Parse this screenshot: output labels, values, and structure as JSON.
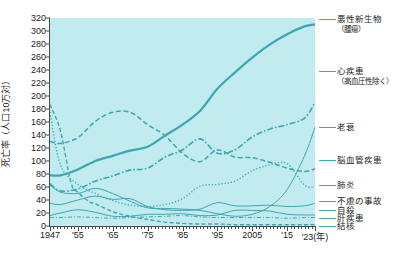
{
  "chart_data": {
    "type": "line",
    "title": "",
    "xlabel": "年",
    "ylabel": "死亡率（人口10万対）",
    "ylim": [
      0,
      320
    ],
    "ytick_step": 20,
    "xlim": [
      1947,
      2023
    ],
    "grid": false,
    "legend_position": "right",
    "background_color": "#c2ebf0",
    "line_color": "#3aa8b0",
    "y_ticks": [
      "0",
      "20",
      "40",
      "60",
      "80",
      "100",
      "120",
      "140",
      "160",
      "180",
      "200",
      "220",
      "240",
      "260",
      "280",
      "300",
      "320"
    ],
    "x_ticks": [
      {
        "label": "1947",
        "year": 1947
      },
      {
        "label": "'55",
        "year": 1955
      },
      {
        "label": "'65",
        "year": 1965
      },
      {
        "label": "'75",
        "year": 1975
      },
      {
        "label": "'85",
        "year": 1985
      },
      {
        "label": "'95",
        "year": 1995
      },
      {
        "label": "2005",
        "year": 2005
      },
      {
        "label": "'15",
        "year": 2015
      },
      {
        "label": "'23(年)",
        "year": 2023
      }
    ],
    "series": [
      {
        "name": "悪性新生物（腫瘍）",
        "legend_label": "悪性新生物",
        "legend_sublabel": "（腫瘍）",
        "style": "solid-thick",
        "x": [
          1947,
          1950,
          1955,
          1960,
          1965,
          1970,
          1975,
          1980,
          1985,
          1990,
          1995,
          2000,
          2005,
          2010,
          2015,
          2020,
          2023
        ],
        "y": [
          78,
          78,
          87,
          100,
          108,
          116,
          122,
          139,
          156,
          177,
          211,
          236,
          259,
          279,
          295,
          307,
          310
        ]
      },
      {
        "name": "心疾患（高血圧性除く）",
        "legend_label": "心疾患",
        "legend_sublabel": "（高血圧性除く）",
        "style": "dash-dot",
        "x": [
          1947,
          1950,
          1955,
          1960,
          1965,
          1970,
          1975,
          1980,
          1985,
          1990,
          1995,
          2000,
          2005,
          2010,
          2015,
          2020,
          2023
        ],
        "y": [
          65,
          54,
          57,
          69,
          77,
          86,
          89,
          106,
          117,
          134,
          112,
          117,
          137,
          149,
          156,
          166,
          190
        ]
      },
      {
        "name": "老衰",
        "legend_label": "老衰",
        "legend_sublabel": "",
        "style": "solid-thin",
        "x": [
          1947,
          1950,
          1955,
          1960,
          1965,
          1970,
          1975,
          1980,
          1985,
          1990,
          1995,
          2000,
          2005,
          2010,
          2015,
          2020,
          2023
        ],
        "y": [
          63,
          52,
          50,
          58,
          50,
          38,
          28,
          27,
          26,
          24,
          19,
          15,
          18,
          30,
          56,
          108,
          152
        ]
      },
      {
        "name": "脳血管疾患",
        "legend_label": "脳血管疾患",
        "legend_sublabel": "",
        "style": "dash-long",
        "x": [
          1947,
          1950,
          1955,
          1960,
          1965,
          1970,
          1975,
          1980,
          1985,
          1990,
          1995,
          2000,
          2005,
          2010,
          2015,
          2020,
          2023
        ],
        "y": [
          130,
          127,
          136,
          161,
          175,
          175,
          156,
          139,
          112,
          99,
          117,
          106,
          105,
          98,
          89,
          84,
          88
        ]
      },
      {
        "name": "肺炎",
        "legend_label": "肺炎",
        "legend_sublabel": "",
        "style": "dotted",
        "x": [
          1947,
          1950,
          1955,
          1960,
          1965,
          1970,
          1975,
          1980,
          1985,
          1990,
          1995,
          2000,
          2005,
          2010,
          2015,
          2020,
          2023
        ],
        "y": [
          175,
          94,
          64,
          50,
          39,
          32,
          30,
          33,
          42,
          61,
          64,
          69,
          85,
          94,
          96,
          63,
          60
        ]
      },
      {
        "name": "不慮の事故",
        "legend_label": "不慮の事故",
        "legend_sublabel": "",
        "style": "solid-thin",
        "x": [
          1947,
          1950,
          1955,
          1960,
          1965,
          1970,
          1975,
          1980,
          1985,
          1990,
          1995,
          2000,
          2005,
          2010,
          2015,
          2020,
          2023
        ],
        "y": [
          35,
          33,
          40,
          46,
          41,
          42,
          30,
          25,
          24,
          26,
          36,
          31,
          31,
          32,
          30,
          31,
          35
        ]
      },
      {
        "name": "自殺",
        "legend_label": "自殺",
        "legend_sublabel": "",
        "style": "solid-thin",
        "x": [
          1947,
          1950,
          1955,
          1960,
          1965,
          1970,
          1975,
          1980,
          1985,
          1990,
          1995,
          2000,
          2005,
          2010,
          2015,
          2020,
          2023
        ],
        "y": [
          16,
          20,
          25,
          21,
          15,
          15,
          18,
          18,
          19,
          16,
          17,
          24,
          24,
          23,
          18,
          17,
          17
        ]
      },
      {
        "name": "肝疾患",
        "legend_label": "肝疾患",
        "legend_sublabel": "",
        "style": "dash-dot-thin",
        "x": [
          1947,
          1950,
          1955,
          1960,
          1965,
          1970,
          1975,
          1980,
          1985,
          1990,
          1995,
          2000,
          2005,
          2010,
          2015,
          2020,
          2023
        ],
        "y": [
          13,
          13,
          14,
          13,
          12,
          13,
          14,
          15,
          16,
          14,
          13,
          13,
          13,
          13,
          12,
          13,
          13
        ]
      },
      {
        "name": "結核",
        "legend_label": "結核",
        "legend_sublabel": "",
        "style": "dash-med",
        "x": [
          1947,
          1950,
          1953,
          1955,
          1958,
          1960,
          1965,
          1970,
          1975,
          1980,
          1985,
          1990,
          1995,
          2000,
          2005,
          2010,
          2015,
          2020,
          2023
        ],
        "y": [
          187,
          146,
          67,
          52,
          38,
          34,
          22,
          15,
          10,
          6,
          4,
          3,
          3,
          2,
          2,
          2,
          2,
          2,
          2
        ]
      }
    ]
  },
  "legend": {
    "items": [
      {
        "label": "悪性新生物",
        "sub": "（腫瘍）"
      },
      {
        "label": "心疾患",
        "sub": "（高血圧性除く）"
      },
      {
        "label": "老衰",
        "sub": ""
      },
      {
        "label": "脳血管疾患",
        "sub": ""
      },
      {
        "label": "肺炎",
        "sub": ""
      },
      {
        "label": "不慮の事故",
        "sub": ""
      },
      {
        "label": "自殺",
        "sub": ""
      },
      {
        "label": "肝疾患",
        "sub": ""
      },
      {
        "label": "結核",
        "sub": ""
      }
    ]
  }
}
